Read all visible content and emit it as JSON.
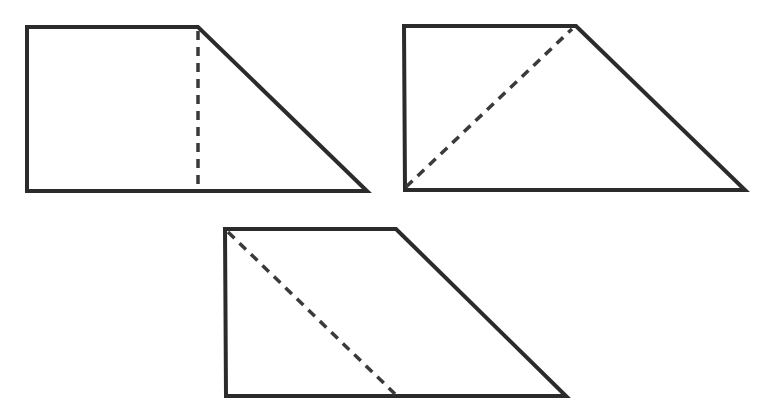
{
  "diagram": {
    "stroke_color": "#2b2b2b",
    "dashed_color": "#3a3a3a",
    "background": "#ffffff",
    "shapes": [
      {
        "id": "trapezoid-1",
        "points": "27,27 198,27 367,191 27,191",
        "dashed_line": {
          "x1": 198,
          "y1": 31,
          "x2": 198,
          "y2": 191,
          "orientation": "vertical"
        }
      },
      {
        "id": "trapezoid-2",
        "points": "404,26 576,26 745,190 405,190",
        "dashed_line": {
          "x1": 406,
          "y1": 187,
          "x2": 572,
          "y2": 29,
          "orientation": "diagonal"
        }
      },
      {
        "id": "trapezoid-3",
        "points": "225,229 396,229 566,396 226,396",
        "dashed_line": {
          "x1": 228,
          "y1": 232,
          "x2": 395,
          "y2": 394,
          "orientation": "diagonal"
        }
      }
    ]
  }
}
